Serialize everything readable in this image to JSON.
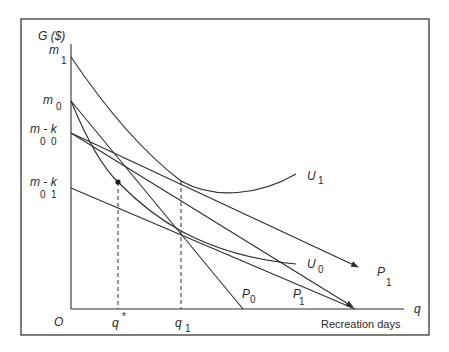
{
  "diagram": {
    "type": "economics-consumer-choice",
    "y_axis": {
      "label": "G ($)"
    },
    "x_axis": {
      "label": "q",
      "description": "Recreation days"
    },
    "origin": "O",
    "y_ticks": [
      {
        "main": "m",
        "sub": "1"
      },
      {
        "main": "m",
        "sub": "0"
      },
      {
        "main": "m - k",
        "sub": "0  0"
      },
      {
        "main": "m - k",
        "sub": "0  1"
      }
    ],
    "x_ticks": [
      {
        "main": "q",
        "sup": "*"
      },
      {
        "main": "q",
        "sub": "1"
      }
    ],
    "curves": [
      {
        "main": "U",
        "sub": "1"
      },
      {
        "main": "U",
        "sub": "0"
      }
    ],
    "lines": [
      {
        "main": "P",
        "sub": "0"
      },
      {
        "main": "P",
        "sub": "1",
        "position": "axis"
      },
      {
        "main": "P",
        "sub": "1",
        "position": "arrow"
      }
    ],
    "colors": {
      "line": "#2e2e2e",
      "background": "#ffffff"
    }
  }
}
